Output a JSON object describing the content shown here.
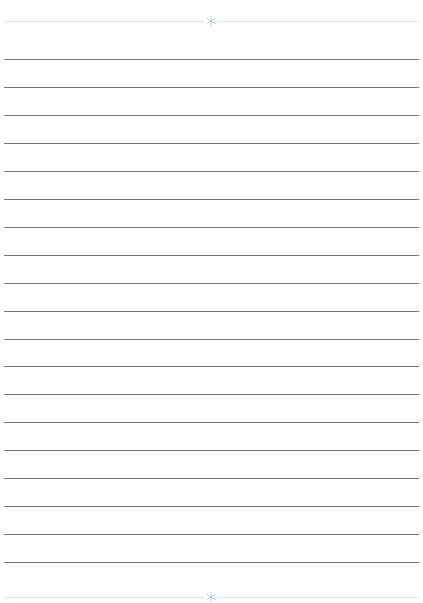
{
  "page": {
    "type": "lined-paper",
    "background": "#ffffff"
  },
  "top_border": {
    "y": 21,
    "color": "#cfe6ee",
    "ornament": {
      "icon": "snowflake-icon",
      "x": 211,
      "color": "#9fd0e0"
    }
  },
  "bottom_border": {
    "y": 597,
    "color": "#cfe6ee",
    "ornament": {
      "icon": "snowflake-icon",
      "x": 211,
      "color": "#9fd0e0"
    }
  },
  "rules": {
    "count": 19,
    "first_y": 59,
    "spacing": 27.95,
    "left": 4,
    "right": 419,
    "color": "#5a5a5a"
  }
}
